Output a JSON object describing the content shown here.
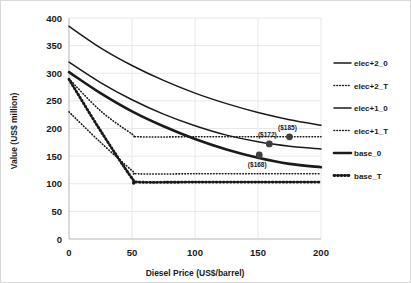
{
  "chart_data": {
    "type": "line",
    "title": "",
    "xlabel": "Diesel Price (US$/barrel)",
    "ylabel": "Value (US$ million)",
    "xlim": [
      0,
      200
    ],
    "ylim": [
      0,
      400
    ],
    "xticks": [
      0,
      50,
      100,
      150,
      200
    ],
    "yticks": [
      0,
      50,
      100,
      150,
      200,
      250,
      300,
      350,
      400
    ],
    "grid": true,
    "legend_position": "right",
    "series": [
      {
        "name": "elec+2_0",
        "style": "solid-thin",
        "x": [
          0,
          25,
          50,
          75,
          100,
          125,
          150,
          175,
          200
        ],
        "values": [
          385,
          346,
          314,
          287,
          264,
          245,
          229,
          216,
          206
        ]
      },
      {
        "name": "elec+2_T",
        "style": "dotted-thin",
        "x": [
          0,
          25,
          50,
          55,
          100,
          150,
          200
        ],
        "values": [
          290,
          232,
          190,
          185,
          185,
          185,
          185
        ]
      },
      {
        "name": "elec+1_0",
        "style": "solid-thin",
        "x": [
          0,
          25,
          50,
          75,
          100,
          125,
          150,
          175,
          200
        ],
        "values": [
          320,
          283,
          252,
          226,
          205,
          188,
          176,
          168,
          163
        ]
      },
      {
        "name": "elec+1_T",
        "style": "dotted-thin",
        "x": [
          0,
          25,
          50,
          55,
          100,
          150,
          200
        ],
        "values": [
          230,
          175,
          124,
          118,
          118,
          118,
          118
        ]
      },
      {
        "name": "base_0",
        "style": "solid-thick",
        "x": [
          0,
          25,
          50,
          75,
          100,
          125,
          150,
          175,
          200
        ],
        "values": [
          302,
          264,
          231,
          204,
          181,
          162,
          147,
          136,
          130
        ]
      },
      {
        "name": "base_T",
        "style": "dotted-thick",
        "x": [
          0,
          25,
          50,
          55,
          100,
          150,
          200
        ],
        "values": [
          289,
          196,
          110,
          103,
          103,
          103,
          103
        ]
      }
    ],
    "annotations": [
      {
        "label": "($185)",
        "x": 175,
        "y": 185,
        "dx": -2,
        "dy": -7
      },
      {
        "label": "($172)",
        "x": 159,
        "y": 172,
        "dx": -2,
        "dy": -7
      },
      {
        "label": "($168)",
        "x": 151,
        "y": 152,
        "dx": -2,
        "dy": 12
      }
    ],
    "markers": [
      {
        "x": 175,
        "y": 185
      },
      {
        "x": 159,
        "y": 172
      },
      {
        "x": 151,
        "y": 152
      }
    ]
  },
  "legend": {
    "items": [
      {
        "label": "elec+2_0",
        "style": "solid-thin"
      },
      {
        "label": "elec+2_T",
        "style": "dotted-thin"
      },
      {
        "label": "elec+1_0",
        "style": "solid-thin"
      },
      {
        "label": "elec+1_T",
        "style": "dotted-thin"
      },
      {
        "label": "base_0",
        "style": "solid-thick"
      },
      {
        "label": "base_T",
        "style": "dotted-thick"
      }
    ]
  }
}
